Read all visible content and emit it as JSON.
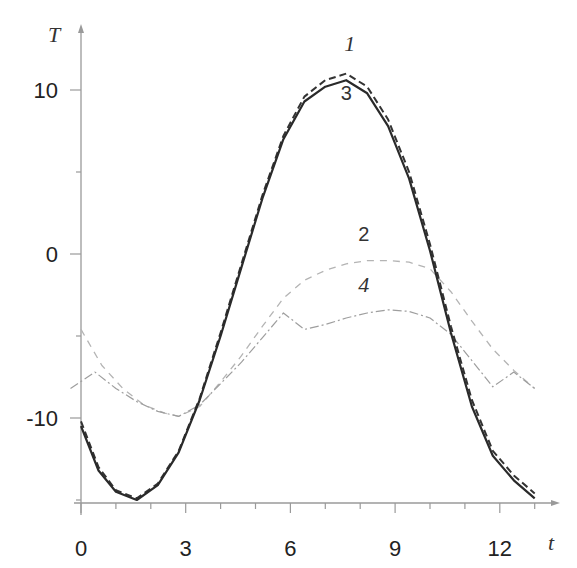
{
  "chart_data": {
    "type": "line",
    "title": "",
    "xlabel": "t",
    "ylabel": "T",
    "xlim": [
      -0.3,
      13.5
    ],
    "ylim": [
      -15.2,
      13
    ],
    "grid": false,
    "legend": "inline curve labels",
    "x_ticks": [
      0,
      3,
      6,
      9,
      12
    ],
    "y_ticks": [
      -10,
      0,
      10
    ],
    "x_tick_labels": [
      "0",
      "3",
      "6",
      "9",
      "12"
    ],
    "y_tick_labels": [
      "-10",
      "0",
      "10"
    ],
    "series": [
      {
        "name": "1",
        "style": "dashed-dark",
        "x": [
          0,
          0.5,
          1.0,
          1.6,
          2.2,
          2.8,
          3.4,
          4.0,
          4.6,
          5.2,
          5.8,
          6.4,
          7.0,
          7.6,
          8.2,
          8.8,
          9.4,
          10.0,
          10.6,
          11.2,
          11.8,
          12.4,
          13.0
        ],
        "y": [
          -10.2,
          -13.0,
          -14.4,
          -14.9,
          -14.0,
          -12.0,
          -8.8,
          -4.8,
          -0.6,
          3.6,
          7.2,
          9.6,
          10.6,
          11.0,
          10.2,
          8.2,
          5.0,
          0.6,
          -4.4,
          -8.9,
          -12.0,
          -13.5,
          -14.6
        ]
      },
      {
        "name": "2",
        "style": "dashed-light",
        "x": [
          0,
          0.6,
          1.2,
          1.8,
          2.4,
          2.8,
          3.4,
          4.0,
          4.6,
          5.2,
          5.8,
          6.4,
          7.0,
          7.6,
          8.2,
          8.8,
          9.4,
          10.0,
          10.6,
          11.2,
          11.8,
          12.4,
          13.0
        ],
        "y": [
          -4.6,
          -6.8,
          -8.2,
          -9.2,
          -9.7,
          -9.9,
          -9.3,
          -7.8,
          -6.2,
          -4.4,
          -2.7,
          -1.6,
          -1.0,
          -0.6,
          -0.4,
          -0.4,
          -0.5,
          -0.9,
          -2.3,
          -4.1,
          -5.8,
          -7.1,
          -8.2
        ]
      },
      {
        "name": "3",
        "style": "solid-dark",
        "x": [
          0,
          0.5,
          1.0,
          1.6,
          2.2,
          2.8,
          3.4,
          4.0,
          4.6,
          5.2,
          5.8,
          6.4,
          7.0,
          7.6,
          8.2,
          8.8,
          9.4,
          10.0,
          10.6,
          11.2,
          11.8,
          12.4,
          13.0
        ],
        "y": [
          -10.5,
          -13.2,
          -14.5,
          -15.0,
          -14.1,
          -12.1,
          -8.9,
          -5.0,
          -0.8,
          3.4,
          7.0,
          9.3,
          10.2,
          10.6,
          9.8,
          7.8,
          4.6,
          0.2,
          -4.8,
          -9.3,
          -12.3,
          -13.8,
          -14.9
        ]
      },
      {
        "name": "4",
        "style": "dash-dot-light",
        "x": [
          -0.3,
          0.4,
          1.0,
          1.6,
          2.2,
          2.8,
          3.4,
          4.0,
          4.6,
          5.2,
          5.8,
          6.4,
          7.0,
          7.6,
          8.2,
          8.8,
          9.4,
          10.0,
          10.6,
          11.2,
          11.8,
          12.4,
          13.0
        ],
        "y": [
          -8.2,
          -7.2,
          -8.2,
          -9.0,
          -9.6,
          -9.9,
          -9.2,
          -7.9,
          -6.6,
          -5.1,
          -3.6,
          -4.6,
          -4.3,
          -3.9,
          -3.6,
          -3.4,
          -3.5,
          -3.9,
          -4.9,
          -6.5,
          -8.1,
          -7.2,
          -8.2
        ]
      }
    ],
    "annotations": [
      {
        "text": "1",
        "x": 7.7,
        "y": 12.4
      },
      {
        "text": "3",
        "x": 7.6,
        "y": 9.4
      },
      {
        "text": "2",
        "x": 8.1,
        "y": 0.8
      },
      {
        "text": "4",
        "x": 8.1,
        "y": -2.3
      }
    ]
  }
}
